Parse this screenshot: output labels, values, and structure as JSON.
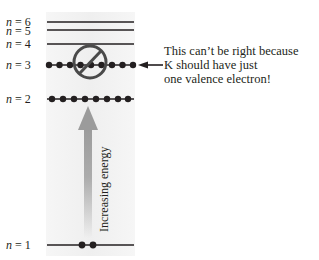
{
  "diagram": {
    "levels": [
      {
        "n": "6",
        "label_prefix": "n",
        "label_eq": " = 6",
        "y": 22,
        "electrons": 0
      },
      {
        "n": "5",
        "label_prefix": "n",
        "label_eq": " = 5",
        "y": 30,
        "electrons": 0
      },
      {
        "n": "4",
        "label_prefix": "n",
        "label_eq": " = 4",
        "y": 44,
        "electrons": 0
      },
      {
        "n": "3",
        "label_prefix": "n",
        "label_eq": " = 3",
        "y": 65,
        "electrons": 9
      },
      {
        "n": "2",
        "label_prefix": "n",
        "label_eq": " = 2",
        "y": 99,
        "electrons": 8
      },
      {
        "n": "1",
        "label_prefix": "n",
        "label_eq": " = 1",
        "y": 245,
        "electrons": 2
      }
    ],
    "annotation": {
      "lines": [
        "This can’t be right because",
        "K should have just",
        "one valence electron!"
      ],
      "points_to_level": "3"
    },
    "energy_arrow": {
      "label": "Increasing energy",
      "direction": "up"
    },
    "prohibition_symbol": {
      "over_level": "3",
      "meaning": "not allowed"
    },
    "colors": {
      "line": "#231f20",
      "electron": "#231f20",
      "arrow": "#9b9b9b",
      "panel": "#f3f3f3",
      "prohibition": "#4a4a4a"
    }
  }
}
